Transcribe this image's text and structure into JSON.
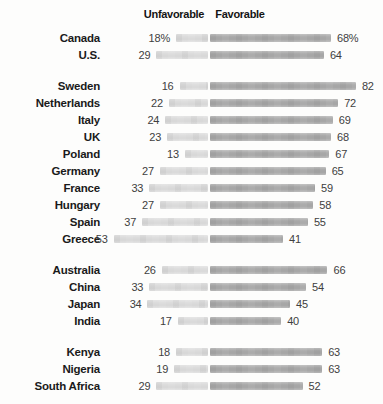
{
  "header": {
    "unfavorable_label": "Unfavorable",
    "favorable_label": "Favorable"
  },
  "colors": {
    "unfavorable_bar": "#dbdbdb",
    "favorable_bar": "#a8a8a8",
    "country_text": "#1a1a1a",
    "value_text": "#404040"
  },
  "chart_data": {
    "type": "bar",
    "orientation": "horizontal",
    "diverging": true,
    "title": "",
    "legend": [
      "Unfavorable",
      "Favorable"
    ],
    "unit": "percent",
    "categories": [
      "Canada",
      "U.S.",
      "Sweden",
      "Netherlands",
      "Italy",
      "UK",
      "Poland",
      "Germany",
      "France",
      "Hungary",
      "Spain",
      "Greece",
      "Australia",
      "China",
      "Japan",
      "India",
      "Kenya",
      "Nigeria",
      "South Africa"
    ],
    "series": [
      {
        "name": "Unfavorable",
        "values": [
          18,
          29,
          16,
          22,
          24,
          23,
          13,
          27,
          33,
          27,
          37,
          53,
          26,
          33,
          34,
          17,
          18,
          19,
          29
        ]
      },
      {
        "name": "Favorable",
        "values": [
          68,
          64,
          82,
          72,
          69,
          68,
          67,
          65,
          59,
          58,
          55,
          41,
          66,
          54,
          45,
          40,
          63,
          63,
          52
        ]
      }
    ],
    "groups": [
      {
        "rows": [
          {
            "country": "Canada",
            "unfavorable": 18,
            "favorable": 68,
            "unfavorable_label": "18%",
            "favorable_label": "68%"
          },
          {
            "country": "U.S.",
            "unfavorable": 29,
            "favorable": 64,
            "unfavorable_label": "29",
            "favorable_label": "64"
          }
        ]
      },
      {
        "rows": [
          {
            "country": "Sweden",
            "unfavorable": 16,
            "favorable": 82,
            "unfavorable_label": "16",
            "favorable_label": "82"
          },
          {
            "country": "Netherlands",
            "unfavorable": 22,
            "favorable": 72,
            "unfavorable_label": "22",
            "favorable_label": "72"
          },
          {
            "country": "Italy",
            "unfavorable": 24,
            "favorable": 69,
            "unfavorable_label": "24",
            "favorable_label": "69"
          },
          {
            "country": "UK",
            "unfavorable": 23,
            "favorable": 68,
            "unfavorable_label": "23",
            "favorable_label": "68"
          },
          {
            "country": "Poland",
            "unfavorable": 13,
            "favorable": 67,
            "unfavorable_label": "13",
            "favorable_label": "67"
          },
          {
            "country": "Germany",
            "unfavorable": 27,
            "favorable": 65,
            "unfavorable_label": "27",
            "favorable_label": "65"
          },
          {
            "country": "France",
            "unfavorable": 33,
            "favorable": 59,
            "unfavorable_label": "33",
            "favorable_label": "59"
          },
          {
            "country": "Hungary",
            "unfavorable": 27,
            "favorable": 58,
            "unfavorable_label": "27",
            "favorable_label": "58"
          },
          {
            "country": "Spain",
            "unfavorable": 37,
            "favorable": 55,
            "unfavorable_label": "37",
            "favorable_label": "55"
          },
          {
            "country": "Greece",
            "unfavorable": 53,
            "favorable": 41,
            "unfavorable_label": "53",
            "favorable_label": "41"
          }
        ]
      },
      {
        "rows": [
          {
            "country": "Australia",
            "unfavorable": 26,
            "favorable": 66,
            "unfavorable_label": "26",
            "favorable_label": "66"
          },
          {
            "country": "China",
            "unfavorable": 33,
            "favorable": 54,
            "unfavorable_label": "33",
            "favorable_label": "54"
          },
          {
            "country": "Japan",
            "unfavorable": 34,
            "favorable": 45,
            "unfavorable_label": "34",
            "favorable_label": "45"
          },
          {
            "country": "India",
            "unfavorable": 17,
            "favorable": 40,
            "unfavorable_label": "17",
            "favorable_label": "40"
          }
        ]
      },
      {
        "rows": [
          {
            "country": "Kenya",
            "unfavorable": 18,
            "favorable": 63,
            "unfavorable_label": "18",
            "favorable_label": "63"
          },
          {
            "country": "Nigeria",
            "unfavorable": 19,
            "favorable": 63,
            "unfavorable_label": "19",
            "favorable_label": "63"
          },
          {
            "country": "South Africa",
            "unfavorable": 29,
            "favorable": 52,
            "unfavorable_label": "29",
            "favorable_label": "52"
          }
        ]
      }
    ]
  }
}
